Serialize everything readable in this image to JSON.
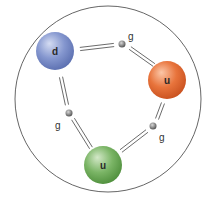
{
  "diagram": {
    "boundary": {
      "cx": 108,
      "cy": 99,
      "r": 93,
      "stroke": "#555555"
    },
    "quarks": [
      {
        "id": "q-d",
        "label": "d",
        "cx": 55,
        "cy": 51,
        "r": 19,
        "color_light": "#d4dcf2",
        "color_mid": "#8597cf",
        "color_dark": "#5b6fb0"
      },
      {
        "id": "q-u-orange",
        "label": "u",
        "cx": 167,
        "cy": 80,
        "r": 19,
        "color_light": "#fbc7a8",
        "color_mid": "#e8743c",
        "color_dark": "#c9511f"
      },
      {
        "id": "q-u-green",
        "label": "u",
        "cx": 103,
        "cy": 165,
        "r": 19,
        "color_light": "#d3e8c8",
        "color_mid": "#7bb566",
        "color_dark": "#4f8f3c"
      }
    ],
    "gluons": [
      {
        "id": "g-top",
        "label": "g",
        "cx": 122,
        "cy": 44,
        "r": 3.5,
        "label_x": 128,
        "label_y": 40
      },
      {
        "id": "g-left",
        "label": "g",
        "cx": 69,
        "cy": 113,
        "r": 3.5,
        "label_x": 55,
        "label_y": 129
      },
      {
        "id": "g-right",
        "label": "g",
        "cx": 153,
        "cy": 126,
        "r": 3.5,
        "label_x": 159,
        "label_y": 141
      }
    ],
    "bonds": [
      {
        "from": "q-d",
        "to": "g-top",
        "x1": 80,
        "y1": 49,
        "x2": 114,
        "y2": 45
      },
      {
        "from": "g-top",
        "to": "q-u-orange",
        "x1": 130,
        "y1": 48,
        "x2": 154,
        "y2": 65
      },
      {
        "from": "q-d",
        "to": "g-left",
        "x1": 61,
        "y1": 77,
        "x2": 67,
        "y2": 105
      },
      {
        "from": "g-left",
        "to": "q-u-green",
        "x1": 73,
        "y1": 119,
        "x2": 91,
        "y2": 148
      },
      {
        "from": "q-u-orange",
        "to": "g-right",
        "x1": 163,
        "y1": 103,
        "x2": 157,
        "y2": 119
      },
      {
        "from": "g-right",
        "to": "q-u-green",
        "x1": 147,
        "y1": 131,
        "x2": 121,
        "y2": 151
      }
    ],
    "bond_color": "#5a5a5a",
    "bond_gap": 1.6
  }
}
